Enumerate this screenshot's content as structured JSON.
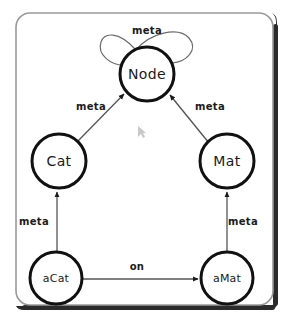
{
  "canvas": {
    "width": 287,
    "height": 331,
    "background": "#ffffff"
  },
  "frame": {
    "label": "diagram-frame",
    "border_color": "#9a9a9a",
    "shadow_color": "#2b2b2b",
    "fill": "#ffffff"
  },
  "diagram": {
    "type": "directed-graph",
    "title": "",
    "node_stroke": "#111111",
    "edge_stroke": "#555555",
    "nodes": [
      {
        "id": "Node",
        "label": "Node",
        "cx": 147,
        "cy": 74,
        "r": 27
      },
      {
        "id": "Cat",
        "label": "Cat",
        "cx": 59,
        "cy": 161,
        "r": 27
      },
      {
        "id": "Mat",
        "label": "Mat",
        "cx": 227,
        "cy": 161,
        "r": 27
      },
      {
        "id": "aCat",
        "label": "aCat",
        "cx": 56,
        "cy": 278,
        "r": 26
      },
      {
        "id": "aMat",
        "label": "aMat",
        "cx": 227,
        "cy": 278,
        "r": 26
      }
    ],
    "edges": [
      {
        "from": "Node",
        "to": "Node",
        "label": "meta",
        "label_x": 147,
        "label_y": 31,
        "kind": "self-loop"
      },
      {
        "from": "Cat",
        "to": "Node",
        "label": "meta",
        "label_x": 91,
        "label_y": 107,
        "kind": "diagonal"
      },
      {
        "from": "Mat",
        "to": "Node",
        "label": "meta",
        "label_x": 210,
        "label_y": 107,
        "kind": "diagonal"
      },
      {
        "from": "aCat",
        "to": "Cat",
        "label": "meta",
        "label_x": 34,
        "label_y": 222,
        "kind": "vertical"
      },
      {
        "from": "aMat",
        "to": "Mat",
        "label": "meta",
        "label_x": 243,
        "label_y": 222,
        "kind": "vertical"
      },
      {
        "from": "aCat",
        "to": "aMat",
        "label": "on",
        "label_x": 137,
        "label_y": 267,
        "kind": "horizontal"
      }
    ]
  },
  "artifacts": {
    "cursor": {
      "x": 139,
      "y": 130,
      "name": "mouse-cursor-artifact"
    }
  }
}
